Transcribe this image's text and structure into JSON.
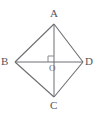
{
  "figure": {
    "kind": "geometry-diagram",
    "shape_name": "quadrilateral-abcd",
    "background_color": "#ffffff",
    "stroke_color": "#6e6e73",
    "label_color": "#55555a",
    "canvas": {
      "width": 99,
      "height": 115
    },
    "vertices": [
      {
        "id": "A",
        "label": "A",
        "x": 54,
        "y": 24,
        "label_x": 50,
        "label_y": 8
      },
      {
        "id": "B",
        "label": "B",
        "x": 15,
        "y": 62,
        "label_x": 1,
        "label_y": 56
      },
      {
        "id": "C",
        "label": "C",
        "x": 54,
        "y": 97,
        "label_x": 50,
        "label_y": 100
      },
      {
        "id": "D",
        "label": "D",
        "x": 83,
        "y": 62,
        "label_x": 85,
        "label_y": 56
      }
    ],
    "center": {
      "id": "O",
      "label": "O",
      "x": 54,
      "y": 62,
      "label_x": 49,
      "label_y": 64
    },
    "sides": [
      {
        "from": "A",
        "to": "B"
      },
      {
        "from": "B",
        "to": "C"
      },
      {
        "from": "C",
        "to": "D"
      },
      {
        "from": "D",
        "to": "A"
      }
    ],
    "diagonals": [
      {
        "from": "A",
        "to": "C",
        "orientation": "vertical"
      },
      {
        "from": "B",
        "to": "D",
        "orientation": "horizontal"
      }
    ],
    "right_angle_marker": {
      "present": true,
      "at": "O",
      "quadrant": "upper-left",
      "size": 6
    }
  }
}
